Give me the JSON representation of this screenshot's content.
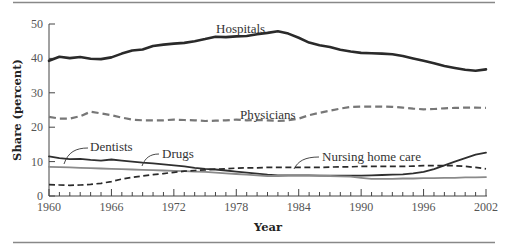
{
  "chart_data": {
    "type": "line",
    "title": "",
    "xlabel": "Year",
    "ylabel": "Share (percent)",
    "xlim": [
      1960,
      2002
    ],
    "ylim": [
      0,
      50
    ],
    "x_ticks": [
      1960,
      1966,
      1972,
      1978,
      1984,
      1990,
      1996,
      2002
    ],
    "y_ticks": [
      0,
      10,
      20,
      30,
      40,
      50
    ],
    "grid": false,
    "legend": "inline labels",
    "x": [
      1960,
      1961,
      1962,
      1963,
      1964,
      1965,
      1966,
      1967,
      1968,
      1969,
      1970,
      1971,
      1972,
      1973,
      1974,
      1975,
      1976,
      1977,
      1978,
      1979,
      1980,
      1981,
      1982,
      1983,
      1984,
      1985,
      1986,
      1987,
      1988,
      1989,
      1990,
      1991,
      1992,
      1993,
      1994,
      1995,
      1996,
      1997,
      1998,
      1999,
      2000,
      2001,
      2002
    ],
    "series": [
      {
        "name": "Hospitals",
        "style": "solid-thick-black",
        "values": [
          39.3,
          40.5,
          40.1,
          40.4,
          39.9,
          39.8,
          40.3,
          41.4,
          42.3,
          42.6,
          43.6,
          44.0,
          44.3,
          44.5,
          45.0,
          45.6,
          46.3,
          46.2,
          46.4,
          46.5,
          47.0,
          47.4,
          47.9,
          47.2,
          46.0,
          44.6,
          43.8,
          43.3,
          42.5,
          42.0,
          41.6,
          41.5,
          41.4,
          41.2,
          40.7,
          40.0,
          39.3,
          38.6,
          37.8,
          37.2,
          36.7,
          36.4,
          36.8
        ]
      },
      {
        "name": "Physicians",
        "style": "dashed-gray",
        "values": [
          23.0,
          22.5,
          22.5,
          23.2,
          24.5,
          24.0,
          23.5,
          22.8,
          22.2,
          22.0,
          22.0,
          22.0,
          22.2,
          22.1,
          22.0,
          21.8,
          21.9,
          22.0,
          22.2,
          22.0,
          22.1,
          22.0,
          21.8,
          22.0,
          22.5,
          23.5,
          24.2,
          24.8,
          25.4,
          25.9,
          26.0,
          26.0,
          26.0,
          25.9,
          25.7,
          25.4,
          25.2,
          25.3,
          25.5,
          25.6,
          25.7,
          25.7,
          25.6
        ]
      },
      {
        "name": "Drugs",
        "style": "solid-black",
        "values": [
          11.5,
          11.0,
          10.7,
          10.8,
          10.5,
          10.3,
          10.6,
          10.3,
          10.0,
          9.7,
          9.5,
          9.2,
          8.9,
          8.6,
          8.2,
          7.9,
          7.7,
          7.4,
          7.1,
          6.8,
          6.5,
          6.2,
          6.0,
          6.0,
          6.0,
          6.0,
          5.9,
          5.9,
          5.9,
          5.9,
          5.9,
          6.0,
          6.1,
          6.2,
          6.3,
          6.6,
          7.0,
          7.8,
          8.9,
          10.0,
          11.0,
          12.0,
          12.6
        ]
      },
      {
        "name": "Dentists",
        "style": "solid-gray",
        "values": [
          8.5,
          8.4,
          8.3,
          8.2,
          8.1,
          8.0,
          7.9,
          7.8,
          7.7,
          7.6,
          7.5,
          7.4,
          7.3,
          7.2,
          7.1,
          7.0,
          6.8,
          6.6,
          6.4,
          6.2,
          6.0,
          5.8,
          5.8,
          5.9,
          5.9,
          5.9,
          5.9,
          5.8,
          5.7,
          5.6,
          5.3,
          5.0,
          5.0,
          5.0,
          5.1,
          5.1,
          5.2,
          5.2,
          5.3,
          5.3,
          5.4,
          5.4,
          5.5
        ]
      },
      {
        "name": "Nursing home care",
        "style": "dashed-black",
        "values": [
          3.3,
          3.2,
          3.1,
          3.2,
          3.4,
          3.7,
          4.2,
          4.9,
          5.4,
          5.8,
          6.2,
          6.5,
          6.9,
          7.2,
          7.4,
          7.6,
          7.8,
          7.9,
          8.1,
          8.2,
          8.2,
          8.3,
          8.3,
          8.3,
          8.3,
          8.3,
          8.3,
          8.4,
          8.5,
          8.5,
          8.6,
          8.6,
          8.6,
          8.6,
          8.6,
          8.7,
          8.8,
          8.8,
          8.8,
          8.8,
          8.6,
          8.3,
          7.9
        ]
      }
    ]
  },
  "labels": {
    "hospitals": "Hospitals",
    "physicians": "Physicians",
    "dentists": "Dentists",
    "drugs": "Drugs",
    "nursing": "Nursing home care",
    "xlabel": "Year",
    "ylabel": "Share (percent)",
    "y_ticks": [
      "0",
      "10",
      "20",
      "30",
      "40",
      "50"
    ],
    "x_ticks": [
      "1960",
      "1966",
      "1972",
      "1978",
      "1984",
      "1990",
      "1996",
      "2002"
    ]
  },
  "colors": {
    "rule": "#888888",
    "axis": "#444444",
    "hospitals": "#2a2a2a",
    "physicians": "#777777",
    "drugs": "#2f2f2f",
    "dentists": "#8a8a8a",
    "nursing": "#2a2a2a"
  }
}
